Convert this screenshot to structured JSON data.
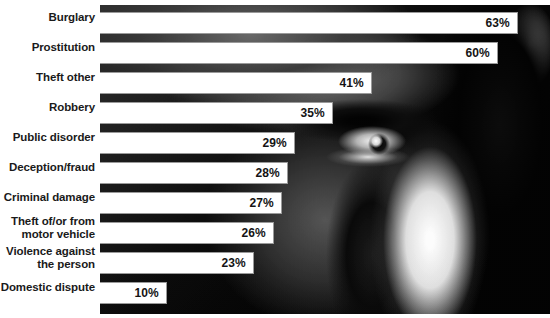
{
  "chart_data": {
    "type": "bar",
    "orientation": "horizontal",
    "title": "",
    "subtitle": "",
    "xlabel": "",
    "ylabel": "",
    "xlim": [
      0,
      70
    ],
    "unit": "%",
    "grid": false,
    "legend": null,
    "background": "grayscale photograph of a man's face (eye, brow, nose, cheek)",
    "bar_color": "#ffffff",
    "label_color": "#1a1a1a",
    "value_color": "#141414",
    "categories": [
      "Burglary",
      "Prostitution",
      "Theft other",
      "Robbery",
      "Public disorder",
      "Deception/fraud",
      "Criminal damage",
      "Theft of/or from motor vehicle",
      "Violence against the person",
      "Domestic dispute"
    ],
    "values": [
      63,
      60,
      41,
      35,
      29,
      28,
      27,
      26,
      23,
      10
    ],
    "data_labels": [
      "63%",
      "60%",
      "41%",
      "35%",
      "29%",
      "28%",
      "27%",
      "26%",
      "23%",
      "10%"
    ]
  },
  "rows": [
    {
      "label": "Burglary",
      "label_lines": [
        "Burglary"
      ],
      "value": "63%",
      "width_px": 418,
      "top": 7,
      "label_top": 11
    },
    {
      "label": "Prostitution",
      "label_lines": [
        "Prostitution"
      ],
      "value": "60%",
      "width_px": 398,
      "top": 37,
      "label_top": 41
    },
    {
      "label": "Theft other",
      "label_lines": [
        "Theft other"
      ],
      "value": "41%",
      "width_px": 272,
      "top": 67,
      "label_top": 71
    },
    {
      "label": "Robbery",
      "label_lines": [
        "Robbery"
      ],
      "value": "35%",
      "width_px": 233,
      "top": 97,
      "label_top": 101
    },
    {
      "label": "Public disorder",
      "label_lines": [
        "Public disorder"
      ],
      "value": "29%",
      "width_px": 195,
      "top": 127,
      "label_top": 131
    },
    {
      "label": "Deception/fraud",
      "label_lines": [
        "Deception/fraud"
      ],
      "value": "28%",
      "width_px": 188,
      "top": 157,
      "label_top": 161
    },
    {
      "label": "Criminal damage",
      "label_lines": [
        "Criminal damage"
      ],
      "value": "27%",
      "width_px": 182,
      "top": 187,
      "label_top": 191
    },
    {
      "label": "Theft of/or from motor vehicle",
      "label_lines": [
        "Theft of/or from",
        "motor vehicle"
      ],
      "value": "26%",
      "width_px": 174,
      "top": 217,
      "label_top": 215
    },
    {
      "label": "Violence against the person",
      "label_lines": [
        "Violence against",
        "the person"
      ],
      "value": "23%",
      "width_px": 154,
      "top": 247,
      "label_top": 245
    },
    {
      "label": "Domestic dispute",
      "label_lines": [
        "Domestic dispute"
      ],
      "value": "10%",
      "width_px": 67,
      "top": 277,
      "label_top": 281
    }
  ]
}
